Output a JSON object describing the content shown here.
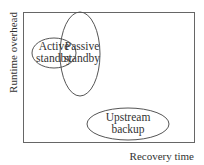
{
  "diagram": {
    "x_axis_label": "Recovery time",
    "y_axis_label": "Runtime overhead",
    "regions": [
      {
        "name": "active-standby",
        "line1": "Active",
        "line2": "standby"
      },
      {
        "name": "passive-standby",
        "line1": "Passive",
        "line2": "standby"
      },
      {
        "name": "upstream-backup",
        "line1": "Upstream",
        "line2": "backup"
      }
    ],
    "colors": {
      "stroke": "#555555",
      "text": "#333333",
      "background": "#ffffff"
    }
  }
}
